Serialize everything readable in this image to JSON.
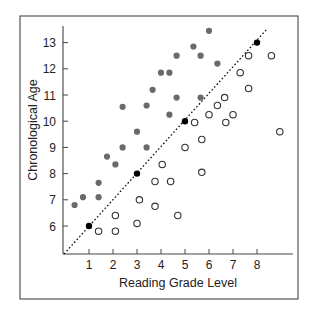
{
  "chart_data": {
    "type": "scatter",
    "title": "",
    "xlabel": "Reading Grade Level",
    "ylabel": "Chronological Age",
    "xlim": [
      0,
      9.5
    ],
    "ylim": [
      5,
      13.5
    ],
    "xticks": [
      1,
      2,
      3,
      4,
      5,
      6,
      7,
      8
    ],
    "yticks": [
      6,
      7,
      8,
      9,
      10,
      11,
      12,
      13
    ],
    "grid": false,
    "legend": null,
    "reference_line": {
      "style": "dotted",
      "from": [
        0,
        5
      ],
      "to": [
        9.3,
        14.3
      ],
      "label": "reading grade level = age - 5"
    },
    "series": [
      {
        "name": "Above diagonal (age exceeds reading level)",
        "marker": "filled-gray",
        "color": "#6a6a6a",
        "points": [
          [
            0.4,
            6.8
          ],
          [
            0.75,
            7.1
          ],
          [
            1.4,
            7.1
          ],
          [
            1.4,
            7.65
          ],
          [
            1.75,
            8.65
          ],
          [
            2.1,
            8.35
          ],
          [
            2.4,
            9.0
          ],
          [
            2.4,
            10.55
          ],
          [
            3.4,
            10.6
          ],
          [
            3.0,
            9.6
          ],
          [
            3.4,
            9.0
          ],
          [
            3.65,
            11.2
          ],
          [
            4.0,
            11.85
          ],
          [
            4.35,
            11.85
          ],
          [
            4.35,
            10.25
          ],
          [
            4.65,
            10.9
          ],
          [
            4.65,
            12.5
          ],
          [
            5.35,
            12.85
          ],
          [
            5.65,
            12.5
          ],
          [
            5.65,
            10.9
          ],
          [
            6.0,
            13.45
          ],
          [
            6.35,
            12.2
          ]
        ]
      },
      {
        "name": "On diagonal",
        "marker": "filled-black",
        "color": "#000000",
        "points": [
          [
            1,
            6
          ],
          [
            3,
            8
          ],
          [
            5,
            10
          ],
          [
            8,
            13
          ]
        ]
      },
      {
        "name": "Below diagonal (reading level exceeds age)",
        "marker": "open-circle",
        "color": "#333333",
        "points": [
          [
            1.4,
            5.8
          ],
          [
            2.1,
            5.8
          ],
          [
            2.1,
            6.4
          ],
          [
            3.0,
            6.1
          ],
          [
            3.1,
            7.0
          ],
          [
            3.75,
            6.75
          ],
          [
            3.75,
            7.7
          ],
          [
            4.4,
            7.7
          ],
          [
            4.7,
            6.4
          ],
          [
            4.05,
            8.35
          ],
          [
            5.0,
            9.0
          ],
          [
            5.7,
            8.05
          ],
          [
            5.7,
            9.3
          ],
          [
            5.4,
            9.95
          ],
          [
            6.0,
            10.25
          ],
          [
            6.35,
            10.6
          ],
          [
            6.7,
            9.95
          ],
          [
            7.0,
            10.25
          ],
          [
            6.65,
            10.9
          ],
          [
            7.3,
            11.85
          ],
          [
            7.65,
            11.25
          ],
          [
            7.65,
            12.5
          ],
          [
            8.6,
            12.5
          ],
          [
            8.95,
            9.6
          ]
        ]
      }
    ]
  },
  "labels": {
    "xlabel": "Reading Grade Level",
    "ylabel": "Chronological Age",
    "xticks": [
      "1",
      "2",
      "3",
      "4",
      "5",
      "6",
      "7",
      "8"
    ],
    "yticks": [
      "6",
      "7",
      "8",
      "9",
      "10",
      "11",
      "12",
      "13"
    ]
  },
  "colors": {
    "filled_gray": "#6a6a6a",
    "filled_black": "#000000",
    "open_stroke": "#333333",
    "axis": "#444444",
    "frame": "#555555"
  }
}
